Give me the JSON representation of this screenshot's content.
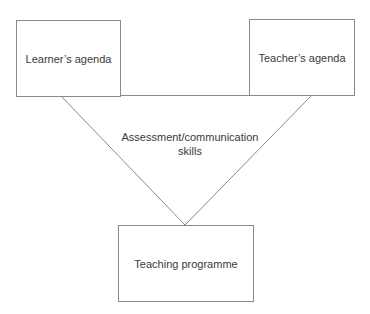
{
  "diagram": {
    "type": "inverted-triangle-relationship",
    "nodes": {
      "learner": {
        "label": "Learner’s agenda"
      },
      "teacher": {
        "label": "Teacher’s agenda"
      },
      "programme": {
        "label": "Teaching programme"
      }
    },
    "center_label": {
      "line1": "Assessment/communication",
      "line2": "skills"
    },
    "edges": [
      {
        "from": "learner",
        "to": "teacher"
      },
      {
        "from": "learner",
        "to": "programme"
      },
      {
        "from": "teacher",
        "to": "programme"
      }
    ],
    "colors": {
      "line": "#8a8a8a",
      "text": "#3a3a3a",
      "background": "#ffffff"
    }
  }
}
